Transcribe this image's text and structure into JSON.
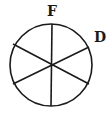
{
  "diagram": {
    "type": "circle-divided-into-sectors",
    "sector_count": 6,
    "stroke_color": "#1a1a1a",
    "background": "#ffffff",
    "circle": {
      "cx": 51,
      "cy": 65,
      "r": 41
    },
    "lines": [
      {
        "x1": 52,
        "y1": 24,
        "x2": 51,
        "y2": 106
      },
      {
        "x1": 13,
        "y1": 44,
        "x2": 89,
        "y2": 84
      },
      {
        "x1": 13,
        "y1": 84,
        "x2": 89,
        "y2": 47
      }
    ],
    "labels": [
      {
        "text": "F",
        "x": 47,
        "y": 4
      },
      {
        "text": "D",
        "x": 94,
        "y": 30
      }
    ]
  }
}
